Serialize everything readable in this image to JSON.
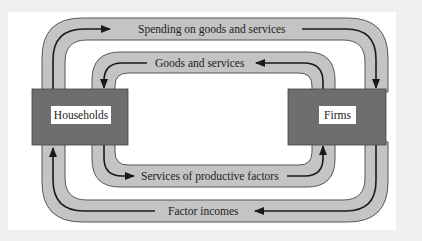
{
  "diagram": {
    "nodes": {
      "households": {
        "label": "Households"
      },
      "firms": {
        "label": "Firms"
      }
    },
    "flows": [
      {
        "id": "spending",
        "label": "Spending on goods and services",
        "from": "households",
        "to": "firms",
        "loop": "outer-top"
      },
      {
        "id": "goods",
        "label": "Goods and services",
        "from": "firms",
        "to": "households",
        "loop": "inner-top"
      },
      {
        "id": "factor_services",
        "label": "Services of productive factors",
        "from": "households",
        "to": "firms",
        "loop": "inner-bottom"
      },
      {
        "id": "factor_incomes",
        "label": "Factor incomes",
        "from": "firms",
        "to": "households",
        "loop": "outer-bottom"
      }
    ],
    "colors": {
      "band_fill": "#c4c4c4",
      "band_stroke": "#555555",
      "box_fill": "#6e6e6e",
      "arrow": "#1a1a1a",
      "label_bg": "#ffffff"
    }
  }
}
